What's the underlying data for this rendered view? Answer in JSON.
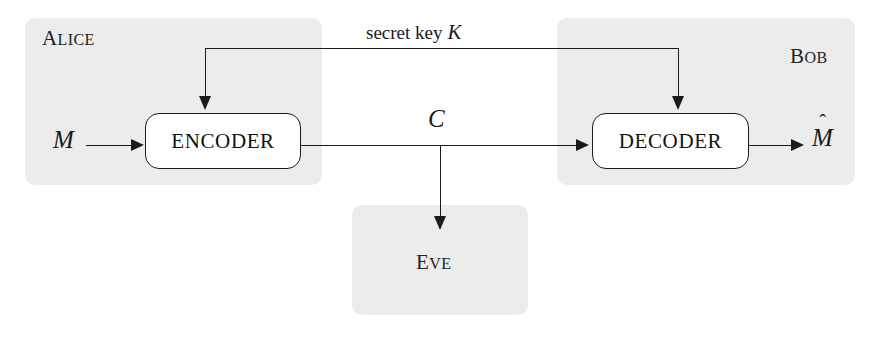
{
  "diagram": {
    "parties": [
      {
        "id": "alice",
        "name_first": "A",
        "name_rest": "LICE"
      },
      {
        "id": "bob",
        "name_first": "B",
        "name_rest": "OB"
      },
      {
        "id": "eve",
        "name_first": "E",
        "name_rest": "VE"
      }
    ],
    "blocks": [
      {
        "id": "encoder",
        "label": "ENCODER"
      },
      {
        "id": "decoder",
        "label": "DECODER"
      }
    ],
    "signals": {
      "plaintext_in": "M",
      "ciphertext": "C",
      "plaintext_out_base": "M",
      "plaintext_out_hat": "ˆ",
      "key_text": "secret key",
      "key_symbol": "K"
    },
    "colors": {
      "region_fill": "#ececec",
      "line": "#1a1a1a",
      "block_fill": "#ffffff",
      "page_background": "#ffffff"
    }
  }
}
